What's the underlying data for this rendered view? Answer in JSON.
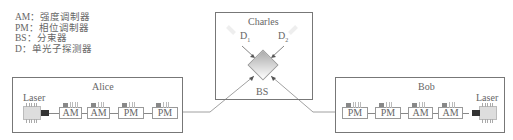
{
  "legend": [
    {
      "abbr": "AM",
      "text": "AM：强度调制器"
    },
    {
      "abbr": "PM",
      "text": "PM：相位调制器"
    },
    {
      "abbr": "BS",
      "text": "BS：分束器"
    },
    {
      "abbr": "D",
      "text": "D：单光子探测器"
    }
  ],
  "charles": {
    "title": "Charles",
    "d1": "D",
    "d1_sub": "1",
    "d2": "D",
    "d2_sub": "2",
    "bs_label": "BS"
  },
  "alice": {
    "title": "Alice",
    "laser_label": "Laser",
    "modules": [
      "AM",
      "AM",
      "PM",
      "PM"
    ]
  },
  "bob": {
    "title": "Bob",
    "laser_label": "Laser",
    "modules": [
      "PM",
      "PM",
      "AM",
      "AM"
    ]
  }
}
